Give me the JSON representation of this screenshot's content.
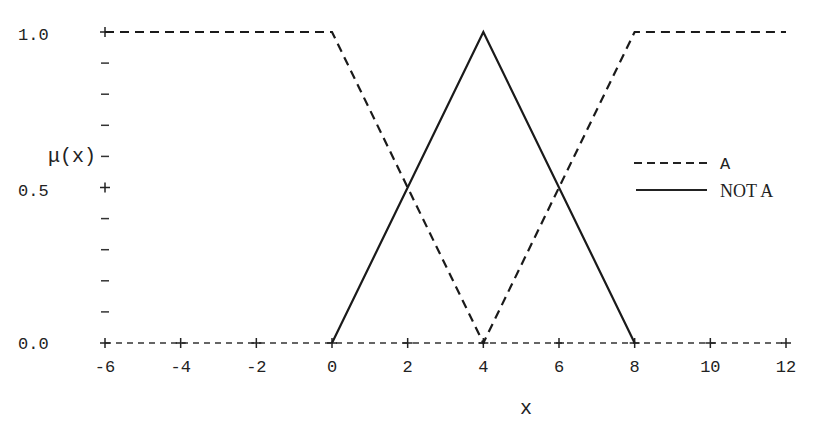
{
  "chart_data": {
    "type": "line",
    "title": "",
    "xlabel": "x",
    "ylabel": "μ(x)",
    "xlim": [
      -6,
      12
    ],
    "ylim": [
      0.0,
      1.0
    ],
    "x_ticks": [
      -6,
      -4,
      -2,
      0,
      2,
      4,
      6,
      8,
      10,
      12
    ],
    "y_tick_labels": [
      "0.0",
      "0.5",
      "1.0"
    ],
    "y_minor_ticks": [
      0.1,
      0.2,
      0.3,
      0.4,
      0.6,
      0.7,
      0.8,
      0.9
    ],
    "grid": false,
    "legend_position": "right",
    "series": [
      {
        "name": "A",
        "style": "dashed",
        "x": [
          -6,
          0,
          4,
          8,
          12
        ],
        "y": [
          1.0,
          1.0,
          0.0,
          1.0,
          1.0
        ]
      },
      {
        "name": "NOT A",
        "style": "solid",
        "x": [
          0,
          4,
          8
        ],
        "y": [
          0.0,
          1.0,
          0.0
        ]
      }
    ]
  },
  "labels": {
    "ylabel": "μ(x)",
    "xlabel": "x",
    "legend_a": "A",
    "legend_not_a": "NOT A",
    "y_1": "1.0",
    "y_05": "0.5",
    "y_0": "0.0"
  }
}
